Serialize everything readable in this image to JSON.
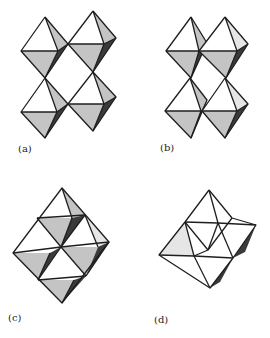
{
  "figure": {
    "panels": [
      {
        "id": "a",
        "label": "(a)",
        "content": "four corner-sharing octahedra in square arrangement"
      },
      {
        "id": "b",
        "label": "(b)",
        "content": "four octahedra, shifted corner/edge sharing"
      },
      {
        "id": "c",
        "label": "(c)",
        "content": "four edge-sharing octahedra forming a rhombus"
      },
      {
        "id": "d",
        "label": "(d)",
        "content": "edge-sharing octahedral cluster, irregular outline"
      }
    ],
    "colors": {
      "edge": "#1e1e1e",
      "face_light": "#ffffff",
      "face_mid": "#c4c4c4",
      "face_dark": "#3a3a3a",
      "background": "#ffffff"
    }
  }
}
